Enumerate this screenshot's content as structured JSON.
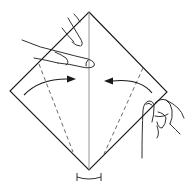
{
  "diagram": {
    "type": "origami-folding-step",
    "colors": {
      "line": "#1a1a1a",
      "crease": "#8a8a8a",
      "background": "#ffffff"
    },
    "paper": {
      "top": [
        89,
        12
      ],
      "left": [
        10,
        91
      ],
      "right": [
        167,
        92
      ],
      "bottom": [
        89,
        170
      ]
    },
    "center_crease": {
      "from": [
        89,
        12
      ],
      "to": [
        89,
        170
      ]
    },
    "valley_folds": [
      {
        "side": "left",
        "from": [
          39,
          64
        ],
        "to": [
          73,
          152
        ]
      },
      {
        "side": "right",
        "from": [
          143,
          68
        ],
        "to": [
          104,
          154
        ]
      }
    ],
    "arrows": [
      {
        "direction": "right",
        "label": "fold-left-flap-to-center"
      },
      {
        "direction": "left",
        "label": "fold-right-flap-to-center"
      }
    ],
    "angle_marker": {
      "position": "bottom",
      "label": "equal-angle-marker"
    },
    "hands": [
      {
        "position": "top-left",
        "action": "pressing-center"
      },
      {
        "position": "bottom-right",
        "action": "holding-corner"
      }
    ]
  }
}
